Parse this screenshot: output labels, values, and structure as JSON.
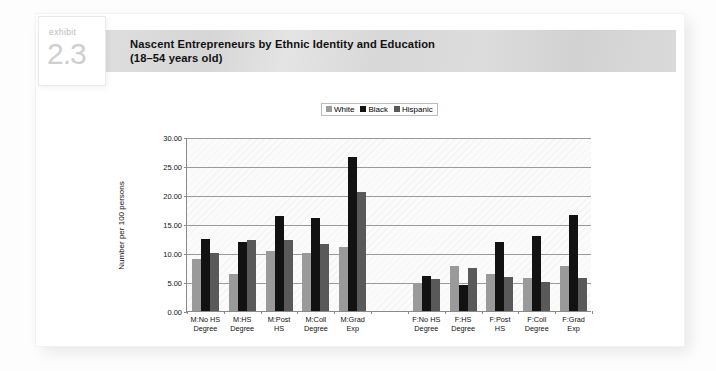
{
  "exhibit": {
    "word": "exhibit",
    "number": "2.3"
  },
  "title": {
    "line1": "Nascent Entrepreneurs by Ethnic Identity and Education",
    "line2": "(18–54 years old)"
  },
  "chart_data": {
    "type": "bar",
    "title": "Nascent Entrepreneurs by Ethnic Identity and Education (18–54 years old)",
    "xlabel": "",
    "ylabel": "Number per 100 persons",
    "ylim": [
      0,
      30
    ],
    "ytick_labels": [
      "0.00",
      "5.00",
      "10.00",
      "15.00",
      "20.00",
      "25.00",
      "30.00"
    ],
    "ytick_values": [
      0,
      5,
      10,
      15,
      20,
      25,
      30
    ],
    "grid": true,
    "legend_position": "top-center",
    "categories": [
      "M:No HS\nDegree",
      "M:HS\nDegree",
      "M:Post\nHS",
      "M:Coll\nDegree",
      "M:Grad\nExp",
      "",
      "F:No HS\nDegree",
      "F:HS\nDegree",
      "F:Post\nHS",
      "F:Coll\nDegree",
      "F:Grad\nExp"
    ],
    "series": [
      {
        "name": "White",
        "color": "#9a9a9a",
        "values": [
          9.0,
          6.3,
          10.3,
          10.0,
          11.0,
          null,
          4.6,
          7.8,
          6.3,
          5.7,
          7.7
        ]
      },
      {
        "name": "Black",
        "color": "#121212",
        "values": [
          12.4,
          11.9,
          16.4,
          16.1,
          26.6,
          null,
          6.0,
          4.5,
          11.9,
          12.9,
          16.5
        ]
      },
      {
        "name": "Hispanic",
        "color": "#595959",
        "values": [
          10.0,
          12.2,
          12.3,
          11.5,
          20.5,
          null,
          5.6,
          7.4,
          5.8,
          5.0,
          5.7
        ]
      }
    ]
  }
}
